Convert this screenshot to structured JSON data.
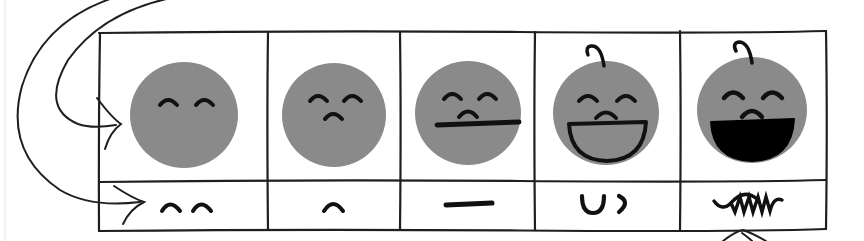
{
  "figure": {
    "kind": "hand-drawn-table-diagram",
    "background_color": "#ffffff",
    "ink_color": "#1a1a1a",
    "face_fill_color": "#8a8a8a",
    "mouth_fill_color": "#000000"
  },
  "table": {
    "left": 99,
    "right": 826,
    "top": 32,
    "bottom": 231,
    "row_divider_y": 181,
    "column_dividers_x": [
      268,
      400,
      535,
      680
    ],
    "row_labels": [
      "faces-row",
      "mouth-symbols-row"
    ],
    "columns": [
      {
        "index": 1,
        "center_x": 184,
        "face": {
          "name": "face-neutral-eyes-only",
          "has_hair_curl": false,
          "eyes": "two-arcs",
          "nose": "none",
          "mouth": "none"
        },
        "symbol": {
          "name": "symbol-two-arcs",
          "glyph": "two small arcs",
          "type": "double-arc"
        }
      },
      {
        "index": 2,
        "center_x": 334,
        "face": {
          "name": "face-small-nose",
          "has_hair_curl": false,
          "eyes": "two-arcs",
          "nose": "small-arc",
          "mouth": "none"
        },
        "symbol": {
          "name": "symbol-single-arc",
          "glyph": "single small arc",
          "type": "single-arc"
        }
      },
      {
        "index": 3,
        "center_x": 468,
        "face": {
          "name": "face-straight-mouth",
          "has_hair_curl": false,
          "eyes": "two-arcs",
          "nose": "small-arc",
          "mouth": "straight-line"
        },
        "symbol": {
          "name": "symbol-straight-line",
          "glyph": "horizontal dash",
          "type": "line"
        }
      },
      {
        "index": 4,
        "center_x": 608,
        "face": {
          "name": "face-open-smile",
          "has_hair_curl": true,
          "eyes": "two-arcs",
          "nose": "small-arc",
          "mouth": "open-half-circle-outline"
        },
        "symbol": {
          "name": "symbol-u-and-paren",
          "glyph": "U )",
          "type": "u-plus-paren"
        }
      },
      {
        "index": 5,
        "center_x": 753,
        "face": {
          "name": "face-laughing-filled-mouth",
          "has_hair_curl": true,
          "eyes": "two-arcs",
          "nose": "small-arc",
          "mouth": "filled-half-circle"
        },
        "symbol": {
          "name": "symbol-scribble",
          "glyph": "zigzag scribble",
          "type": "scribble"
        }
      }
    ]
  },
  "annotations": [
    {
      "name": "arrow-to-faces-row",
      "type": "curved-arrow",
      "points_to": "faces-row",
      "direction": "left-to-right"
    },
    {
      "name": "arrow-to-symbols-row",
      "type": "curved-arrow",
      "points_to": "mouth-symbols-row",
      "direction": "left-to-right"
    },
    {
      "name": "arrow-to-last-symbol",
      "type": "straight-arrow-up",
      "points_to": "symbol-scribble",
      "direction": "bottom-to-top"
    }
  ]
}
